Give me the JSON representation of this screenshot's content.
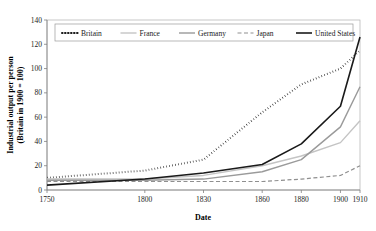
{
  "chart_data": {
    "type": "line",
    "title": "",
    "xlabel": "Date",
    "ylabel": "Industrial output per person\n(Britain in 1900 = 100)",
    "ylabel_line1": "Industrial output per person",
    "ylabel_line2": "(Britain in 1900 = 100)",
    "x": [
      1750,
      1800,
      1830,
      1860,
      1880,
      1900,
      1910
    ],
    "categories": [
      "1750",
      "1800",
      "1830",
      "1860",
      "1880",
      "1900",
      "1910"
    ],
    "xtick_labels": [
      "1750",
      "1800",
      "1830",
      "1860",
      "1880",
      "1900",
      "1910"
    ],
    "ytick_labels": [
      "0",
      "20",
      "40",
      "60",
      "80",
      "100",
      "120",
      "140"
    ],
    "yticks": [
      0,
      20,
      40,
      60,
      80,
      100,
      120,
      140
    ],
    "ylim": [
      0,
      140
    ],
    "grid": false,
    "legend_position": "top-inside",
    "series": [
      {
        "name": "Britain",
        "values": [
          10,
          16,
          25,
          64,
          87,
          100,
          115
        ],
        "color": "#1a1a1a",
        "style": "dotted"
      },
      {
        "name": "France",
        "values": [
          9,
          9,
          12,
          20,
          28,
          39,
          57
        ],
        "color": "#c4c4c4",
        "style": "solid"
      },
      {
        "name": "Germany",
        "values": [
          8,
          8,
          9,
          15,
          25,
          52,
          85
        ],
        "color": "#9a9a9a",
        "style": "solid"
      },
      {
        "name": "Japan",
        "values": [
          7,
          7,
          7,
          7,
          9,
          12,
          20
        ],
        "color": "#8f8f8f",
        "style": "dashed"
      },
      {
        "name": "United States",
        "values": [
          4,
          9,
          14,
          21,
          38,
          69,
          126
        ],
        "color": "#1a1a1a",
        "style": "solid-thick"
      }
    ]
  },
  "legend": {
    "items": [
      {
        "label": "Britain"
      },
      {
        "label": "France"
      },
      {
        "label": "Germany"
      },
      {
        "label": "Japan"
      },
      {
        "label": "United States"
      }
    ]
  }
}
